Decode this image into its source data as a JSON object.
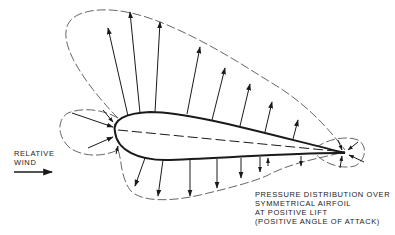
{
  "diagram": {
    "title": "Pressure distribution over symmetrical airfoil at positive lift",
    "wind_label": [
      "RELATIVE",
      "WIND"
    ],
    "caption_lines": [
      "PRESSURE DISTRIBUTION OVER",
      "SYMMETRICAL AIRFOIL",
      "AT POSITIVE LIFT",
      "(POSITIVE ANGLE OF ATTACK)"
    ],
    "elements": {
      "airfoil": "symmetrical airfoil outline, tilted to positive angle of attack",
      "chord_line": "dashed chord line from leading edge to trailing edge",
      "upper_envelope": "dashed pressure envelope over upper surface (suction, arrows point outward/up)",
      "lower_envelope": "dashed pressure envelope below lower surface (arrows point away)",
      "leading_edge_lobe": "dashed lobe ahead of leading edge with arrows pointing into the nose",
      "trailing_edge_lobe": "small dashed lobe around trailing edge with arrows converging",
      "wind_arrow": "arrow pointing right indicating relative wind direction"
    },
    "colors": {
      "ink": "#1a1a1a",
      "background": "#ffffff"
    }
  }
}
